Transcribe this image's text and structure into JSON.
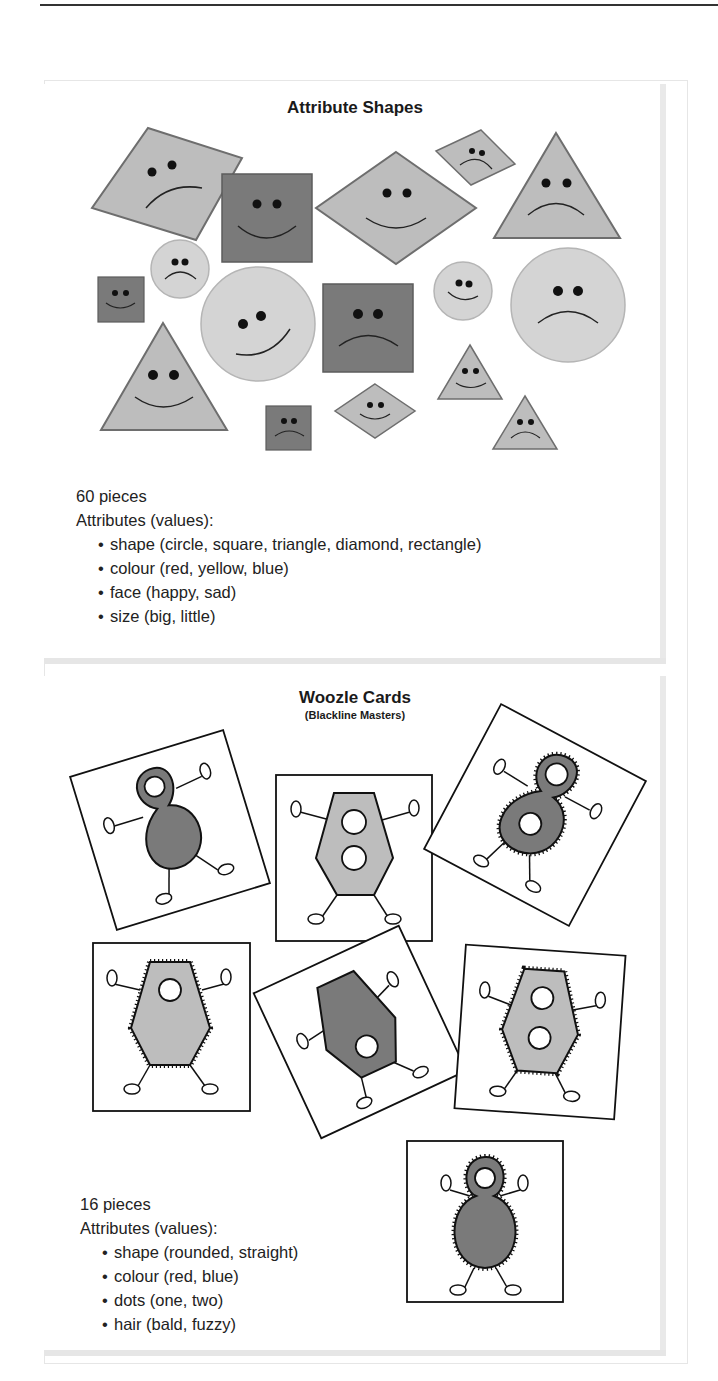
{
  "panels": [
    {
      "title": "Attribute Shapes",
      "count": "60 pieces",
      "attributes_heading": "Attributes (values):",
      "attributes": [
        "shape (circle, square, triangle, diamond, rectangle)",
        "colour (red, yellow, blue)",
        "face (happy, sad)",
        "size (big, little)"
      ],
      "pieces_shown": [
        {
          "shape": "diamond",
          "face": "sad",
          "size": "big"
        },
        {
          "shape": "square",
          "face": "happy",
          "size": "big"
        },
        {
          "shape": "diamond",
          "face": "happy",
          "size": "big"
        },
        {
          "shape": "diamond",
          "face": "sad",
          "size": "little"
        },
        {
          "shape": "triangle",
          "face": "sad",
          "size": "big"
        },
        {
          "shape": "circle",
          "face": "sad",
          "size": "little"
        },
        {
          "shape": "square",
          "face": "happy",
          "size": "little"
        },
        {
          "shape": "circle",
          "face": "happy",
          "size": "big"
        },
        {
          "shape": "square",
          "face": "sad",
          "size": "big"
        },
        {
          "shape": "circle",
          "face": "happy",
          "size": "little"
        },
        {
          "shape": "circle",
          "face": "sad",
          "size": "big"
        },
        {
          "shape": "triangle",
          "face": "happy",
          "size": "big"
        },
        {
          "shape": "triangle",
          "face": "happy",
          "size": "little"
        },
        {
          "shape": "square",
          "face": "sad",
          "size": "little"
        },
        {
          "shape": "diamond",
          "face": "happy",
          "size": "little"
        },
        {
          "shape": "triangle",
          "face": "sad",
          "size": "little"
        }
      ]
    },
    {
      "title": "Woozle Cards",
      "subtitle": "(Blackline Masters)",
      "count": "16 pieces",
      "attributes_heading": "Attributes (values):",
      "attributes": [
        "shape (rounded, straight)",
        "colour (red, blue)",
        "dots (one, two)",
        "hair (bald, fuzzy)"
      ],
      "cards_shown": [
        {
          "shape": "rounded",
          "dots": "one",
          "hair": "bald"
        },
        {
          "shape": "straight",
          "dots": "two",
          "hair": "bald"
        },
        {
          "shape": "rounded",
          "dots": "two",
          "hair": "fuzzy"
        },
        {
          "shape": "straight",
          "dots": "one",
          "hair": "fuzzy"
        },
        {
          "shape": "straight",
          "dots": "one",
          "hair": "bald"
        },
        {
          "shape": "straight",
          "dots": "two",
          "hair": "fuzzy"
        },
        {
          "shape": "rounded",
          "dots": "one",
          "hair": "fuzzy"
        }
      ]
    }
  ],
  "colors": {
    "light_fill": "#bdbdbd",
    "lightest_fill": "#d4d4d4",
    "dark_fill": "#7a7a7a",
    "outline": "#6e6e6e",
    "ink": "#111111"
  }
}
